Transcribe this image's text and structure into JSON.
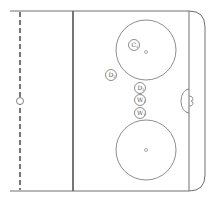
{
  "diagram": {
    "type": "hockey-rink-half",
    "colors": {
      "background": "#ffffff",
      "line": "#707070",
      "dark_line": "#555555"
    },
    "elements": {
      "center_line": {
        "style": "dashed",
        "x": 20
      },
      "center_dot": {
        "x": 20,
        "y": 101,
        "r": 3.5
      },
      "blue_line": {
        "x": 73
      },
      "goal_line": {
        "x": 189
      },
      "top_faceoff_circle": {
        "cx": 146,
        "cy": 50,
        "r": 30,
        "dot": {
          "cx": 146,
          "cy": 52,
          "r": 1.5
        }
      },
      "bottom_faceoff_circle": {
        "cx": 146,
        "cy": 150,
        "r": 30,
        "dot": {
          "cx": 146,
          "cy": 150,
          "r": 1.5
        }
      },
      "goal_crease": {
        "cx": 189,
        "cy": 101
      }
    },
    "players": [
      {
        "id": "c1",
        "letter": "C",
        "sub": "1",
        "cx": 134,
        "cy": 45,
        "r": 5.5
      },
      {
        "id": "d2",
        "letter": "D",
        "sub": "2",
        "cx": 111,
        "cy": 75,
        "r": 5.5
      },
      {
        "id": "d1",
        "letter": "D",
        "sub": "1",
        "cx": 140,
        "cy": 88,
        "r": 5.5
      },
      {
        "id": "w1a",
        "letter": "W",
        "sub": "1",
        "cx": 140,
        "cy": 100,
        "r": 5.5
      },
      {
        "id": "w1b",
        "letter": "W",
        "sub": "1",
        "cx": 140,
        "cy": 113,
        "r": 5.5
      }
    ]
  }
}
